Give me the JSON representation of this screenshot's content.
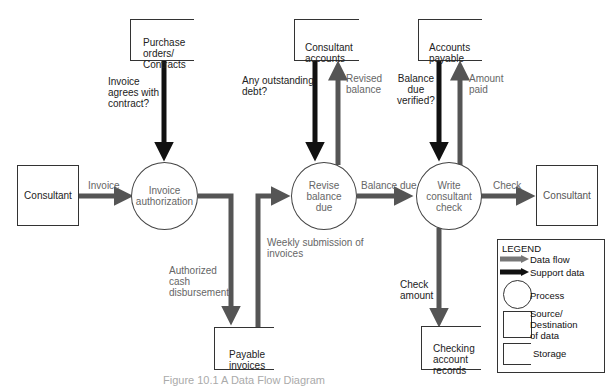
{
  "diagram": {
    "type": "data-flow-diagram",
    "sources": [
      {
        "id": "consultant_in",
        "label": "Consultant"
      },
      {
        "id": "consultant_out",
        "label": "Consultant"
      }
    ],
    "processes": [
      {
        "id": "p1",
        "label": "Invoice\nauthorization"
      },
      {
        "id": "p2",
        "label": "Revise\nbalance\ndue"
      },
      {
        "id": "p3",
        "label": "Write\nconsultant\ncheck"
      }
    ],
    "stores": [
      {
        "id": "s1",
        "label": "Purchase\norders/\nContracts"
      },
      {
        "id": "s2",
        "label": "Consultant\naccounts"
      },
      {
        "id": "s3",
        "label": "Accounts\npayable"
      },
      {
        "id": "s4",
        "label": "Payable\ninvoices"
      },
      {
        "id": "s5",
        "label": "Checking\naccount\nrecords"
      }
    ],
    "flows": {
      "invoice": "Invoice",
      "contract_check": "Invoice\nagrees with\ncontract?",
      "authorized": "Authorized\ncash\ndisbursement",
      "weekly": "Weekly submission of\ninvoices",
      "outstanding": "Any outstanding\ndebt?",
      "revised": "Revised\nbalance",
      "balance_due": "Balance due",
      "verified": "Balance\ndue\nverified?",
      "amount_paid": "Amount\npaid",
      "check": "Check",
      "check_amount": "Check\namount"
    },
    "colors": {
      "data_flow": "#555555",
      "support_data": "#111111"
    }
  },
  "legend": {
    "title": "LEGEND",
    "data_flow": "Data flow",
    "support_data": "Support data",
    "process": "Process",
    "source": "Source/\nDestination\nof data",
    "storage": "Storage"
  },
  "caption": "Figure 10.1   A Data Flow Diagram"
}
